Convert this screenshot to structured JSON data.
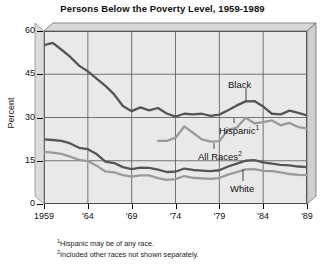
{
  "chart_data": {
    "type": "line",
    "title": "Persons Below the Poverty Level, 1959-1989",
    "xlabel": "",
    "ylabel": "Percent",
    "ylim": [
      0,
      60
    ],
    "xlim": [
      1959,
      1989
    ],
    "yticks": [
      0,
      15,
      30,
      45,
      60
    ],
    "ytick_labels": [
      "0",
      "15",
      "30",
      "45",
      "60"
    ],
    "xticks": [
      1959,
      1964,
      1969,
      1974,
      1979,
      1984,
      1989
    ],
    "xtick_labels": [
      "1959",
      "'64",
      "'69",
      "'74",
      "'79",
      "'84",
      "'89"
    ],
    "grid": true,
    "legend": "inline-labels",
    "x": [
      1959,
      1960,
      1961,
      1962,
      1963,
      1964,
      1965,
      1966,
      1967,
      1968,
      1969,
      1970,
      1971,
      1972,
      1973,
      1974,
      1975,
      1976,
      1977,
      1978,
      1979,
      1980,
      1981,
      1982,
      1983,
      1984,
      1985,
      1986,
      1987,
      1988,
      1989
    ],
    "series": [
      {
        "name": "Black",
        "color": "#555555",
        "label": "Black",
        "label_sup": "",
        "values": [
          55.1,
          55.9,
          53.5,
          51.0,
          48.0,
          46.0,
          43.5,
          41.0,
          38.0,
          34.0,
          32.2,
          33.5,
          32.5,
          33.3,
          31.4,
          30.3,
          31.3,
          31.1,
          31.3,
          30.6,
          31.0,
          32.5,
          34.2,
          35.6,
          35.7,
          33.8,
          31.3,
          31.1,
          32.4,
          31.6,
          30.7
        ]
      },
      {
        "name": "Hispanic",
        "color": "#9a9a9a",
        "label": "Hispanic",
        "label_sup": "1",
        "values": [
          null,
          null,
          null,
          null,
          null,
          null,
          null,
          null,
          null,
          null,
          null,
          null,
          null,
          21.9,
          21.9,
          23.0,
          26.9,
          24.7,
          22.4,
          21.6,
          21.8,
          25.7,
          26.5,
          29.9,
          28.0,
          28.4,
          29.0,
          27.3,
          28.1,
          26.7,
          26.2
        ]
      },
      {
        "name": "All Races",
        "color": "#555555",
        "label": "All Races",
        "label_sup": "2",
        "values": [
          22.4,
          22.2,
          21.9,
          21.0,
          19.5,
          19.0,
          17.3,
          14.7,
          14.2,
          12.8,
          12.1,
          12.6,
          12.5,
          11.9,
          11.1,
          11.2,
          12.3,
          11.8,
          11.6,
          11.4,
          11.7,
          13.0,
          14.0,
          15.0,
          15.2,
          14.4,
          14.0,
          13.6,
          13.4,
          13.0,
          12.8
        ]
      },
      {
        "name": "White",
        "color": "#9a9a9a",
        "label": "White",
        "label_sup": "",
        "values": [
          18.1,
          17.8,
          17.4,
          16.4,
          15.3,
          14.9,
          13.3,
          11.3,
          11.0,
          10.0,
          9.5,
          9.9,
          9.9,
          9.0,
          8.4,
          8.6,
          9.7,
          9.1,
          8.9,
          8.7,
          9.0,
          10.2,
          11.1,
          12.0,
          12.1,
          11.5,
          11.4,
          11.0,
          10.4,
          10.1,
          10.0
        ]
      }
    ],
    "annotations": [
      {
        "name": "black-label",
        "text": "Black",
        "x_px": 228,
        "y_px": 79,
        "leader_x": 246,
        "leader_y1": 88,
        "leader_y2": 101
      },
      {
        "name": "hispanic-label",
        "text": "Hispanic",
        "sup": "1",
        "x_px": 219,
        "y_px": 124,
        "leader_x": 234,
        "leader_y1": 118,
        "leader_y2": 123
      },
      {
        "name": "allraces-label",
        "text": "All Races",
        "sup": "2",
        "x_px": 198,
        "y_px": 150,
        "leader_x": 214,
        "leader_y1": 143,
        "leader_y2": 149
      },
      {
        "name": "white-label",
        "text": "White",
        "x_px": 230,
        "y_px": 183,
        "leader_x": 243,
        "leader_y1": 169,
        "leader_y2": 181
      }
    ],
    "footnotes": [
      {
        "marker": "1",
        "text": "Hispanic may be of any race."
      },
      {
        "marker": "2",
        "text": "Included other races not shown separately."
      }
    ]
  }
}
